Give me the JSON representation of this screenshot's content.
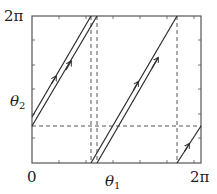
{
  "diagram": {
    "type": "phase-portrait-torus",
    "x_axis": {
      "label": "θ",
      "label_sub": "1",
      "tick_start": "0",
      "tick_end": "2π"
    },
    "y_axis": {
      "label": "θ",
      "label_sub": "2",
      "tick_end": "2π"
    },
    "colors": {
      "line": "#2a2a2a",
      "dash": "#444444",
      "frame": "#555555"
    }
  }
}
